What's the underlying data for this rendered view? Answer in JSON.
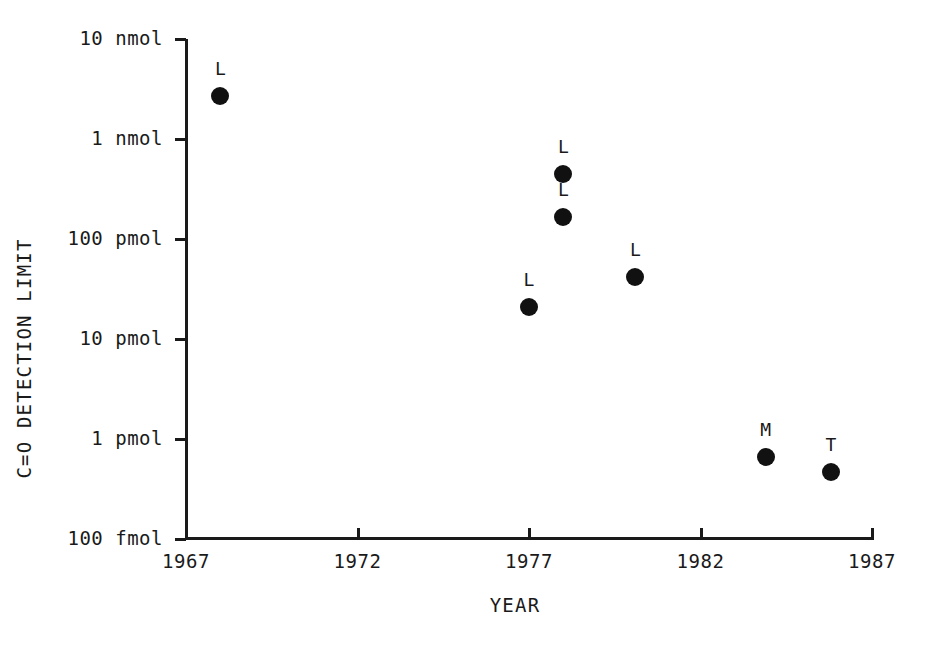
{
  "chart_data": {
    "type": "scatter",
    "title": "",
    "xlabel": "YEAR",
    "ylabel": "C=O DETECTION LIMIT",
    "grid": false,
    "legend": "none",
    "yscale": "log",
    "xlim": [
      1966,
      1987.8
    ],
    "ylim_pmol": [
      0.1,
      10000
    ],
    "y_tick_labels": [
      "10 nmol",
      "1 nmol",
      "100 pmol",
      "10 pmol",
      "1 pmol",
      "100 fmol"
    ],
    "y_tick_values_pmol": [
      10000,
      1000,
      100,
      10,
      1,
      0.1
    ],
    "x_tick_labels": [
      "1967",
      "1972",
      "1977",
      "1982",
      "1987"
    ],
    "x_tick_values": [
      1967,
      1972,
      1977,
      1982,
      1987
    ],
    "points": [
      {
        "label": "L",
        "year": 1968.0,
        "value_pmol": 2700
      },
      {
        "label": "L",
        "year": 1977.0,
        "value_pmol": 21
      },
      {
        "label": "L",
        "year": 1978.0,
        "value_pmol": 450
      },
      {
        "label": "L",
        "year": 1978.0,
        "value_pmol": 165
      },
      {
        "label": "L",
        "year": 1980.1,
        "value_pmol": 42
      },
      {
        "label": "M",
        "year": 1983.9,
        "value_pmol": 0.66
      },
      {
        "label": "T",
        "year": 1985.8,
        "value_pmol": 0.47
      }
    ]
  },
  "colors": {
    "ink": "#1a1a1a",
    "marker": "#111111",
    "background": "#ffffff"
  }
}
